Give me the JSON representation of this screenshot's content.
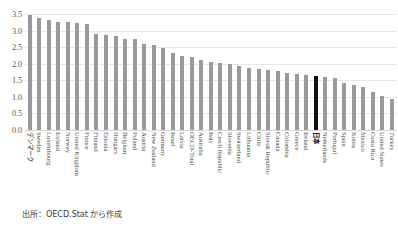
{
  "source_note": "出所：OECD.Stat から作成",
  "axis": {
    "y_ticks": [
      "3.5",
      "3.0",
      "2.5",
      "2.0",
      "1.5",
      "1.0",
      "0.5",
      "0.0"
    ]
  },
  "chart_data": {
    "type": "bar",
    "title": "",
    "xlabel": "",
    "ylabel": "",
    "ylim": [
      0.0,
      3.5
    ],
    "ytick_values": [
      0.0,
      0.5,
      1.0,
      1.5,
      2.0,
      2.5,
      3.0,
      3.5
    ],
    "grid": true,
    "legend": "none",
    "highlight_category": "日本",
    "highlight_color": "#111111",
    "bar_color": "#9a9a9a",
    "categories": [
      "デンマーク",
      "Sweden",
      "Luxembourg",
      "Iceland",
      "Norway",
      "United Kingdom",
      "France",
      "Finland",
      "Estonia",
      "Hungary",
      "Belgium",
      "Poland",
      "Austria",
      "New Zealand",
      "Germany",
      "Israel",
      "Latvia",
      "OECD-Total",
      "Australia",
      "Italy",
      "Czech Republic",
      "Slovenia",
      "Switzerland",
      "Lithuania",
      "Chile",
      "Slovak Republic",
      "Canada",
      "Colombia",
      "Greece",
      "Ireland",
      "日本",
      "Netherlands",
      "Portugal",
      "Spain",
      "Korea",
      "Mexico",
      "Costa Rica",
      "United States",
      "Turkey"
    ],
    "values": [
      3.46,
      3.38,
      3.32,
      3.27,
      3.26,
      3.24,
      3.21,
      2.89,
      2.86,
      2.83,
      2.76,
      2.76,
      2.61,
      2.57,
      2.46,
      2.33,
      2.22,
      2.19,
      2.1,
      2.05,
      2.02,
      1.98,
      1.93,
      1.88,
      1.85,
      1.81,
      1.78,
      1.73,
      1.69,
      1.66,
      1.63,
      1.6,
      1.56,
      1.42,
      1.35,
      1.29,
      1.15,
      1.04,
      0.95
    ]
  }
}
